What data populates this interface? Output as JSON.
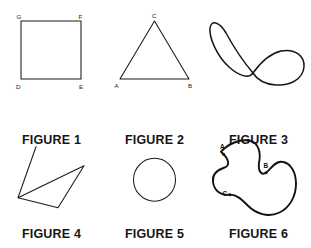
{
  "page": {
    "background_color": "#ffffff",
    "ink_color": "#1a1a1a"
  },
  "figures": [
    {
      "id": "figure-1",
      "caption": "FIGURE 1",
      "shape": "square",
      "description": "Closed four-sided square",
      "vertex_labels": [
        {
          "text": "G",
          "position": "top-left"
        },
        {
          "text": "F",
          "position": "top-right"
        },
        {
          "text": "D",
          "position": "bottom-left"
        },
        {
          "text": "E",
          "position": "bottom-right"
        }
      ]
    },
    {
      "id": "figure-2",
      "caption": "FIGURE 2",
      "shape": "triangle",
      "description": "Closed three-sided triangle",
      "vertex_labels": [
        {
          "text": "C",
          "position": "apex"
        },
        {
          "text": "A",
          "position": "bottom-left"
        },
        {
          "text": "B",
          "position": "bottom-right"
        }
      ]
    },
    {
      "id": "figure-3",
      "caption": "FIGURE 3",
      "shape": "figure-eight-curve",
      "description": "Closed curve crossing itself once, like a figure eight",
      "vertex_labels": []
    },
    {
      "id": "figure-4",
      "caption": "FIGURE 4",
      "shape": "crossed-zigzag",
      "description": "Open zigzag polyline whose segments cross",
      "vertex_labels": []
    },
    {
      "id": "figure-5",
      "caption": "FIGURE 5",
      "shape": "circle",
      "description": "Simple closed circle",
      "vertex_labels": []
    },
    {
      "id": "figure-6",
      "caption": "FIGURE 6",
      "shape": "irregular-closed-blob",
      "description": "Irregular closed curve with three marked points",
      "vertex_labels": [
        {
          "text": "A",
          "position": "upper-left"
        },
        {
          "text": "B",
          "position": "upper-right"
        },
        {
          "text": "C",
          "position": "lower-left"
        }
      ]
    }
  ]
}
